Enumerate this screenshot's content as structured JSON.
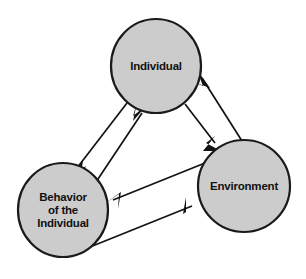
{
  "diagram": {
    "background_color": "#ffffff",
    "node_fill_color": "#cccccc",
    "node_border_color": "#1a1a1a",
    "line_color": "#121212",
    "nodes": [
      {
        "id": "individual",
        "label": "Individual",
        "lines": [
          "Individual"
        ],
        "cx": 156,
        "cy": 66,
        "rx": 45,
        "ry": 47
      },
      {
        "id": "behavior",
        "label": "Behavior of the Individual",
        "lines": [
          "Behavior",
          "of the",
          "Individual"
        ],
        "cx": 63,
        "cy": 210,
        "rx": 45,
        "ry": 47
      },
      {
        "id": "environment",
        "label": "Environment",
        "lines": [
          "Environment"
        ],
        "cx": 244,
        "cy": 186,
        "rx": 46,
        "ry": 46
      }
    ],
    "edges": [
      {
        "id": "individual-to-behavior",
        "from": "individual",
        "to": "behavior",
        "direction": "down-left"
      },
      {
        "id": "behavior-to-individual",
        "from": "behavior",
        "to": "individual",
        "direction": "up-right"
      },
      {
        "id": "individual-to-environment",
        "from": "individual",
        "to": "environment",
        "direction": "down-right"
      },
      {
        "id": "environment-to-individual",
        "from": "environment",
        "to": "individual",
        "direction": "up-left"
      },
      {
        "id": "environment-to-behavior",
        "from": "environment",
        "to": "behavior",
        "direction": "left"
      },
      {
        "id": "behavior-to-environment",
        "from": "behavior",
        "to": "environment",
        "direction": "right"
      }
    ]
  }
}
